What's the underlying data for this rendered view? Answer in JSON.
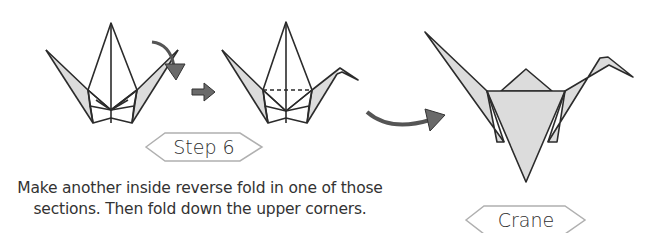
{
  "step_label": "Step 6",
  "final_label": "Crane",
  "instructions": {
    "line1": "Make another inside reverse fold in one of those",
    "line2": "sections. Then fold down the upper corners."
  },
  "icons": {
    "curved_fold_arrow": "curved-arrow-down",
    "next_arrow": "arrow-right",
    "result_arrow": "curved-arrow-right"
  },
  "colors": {
    "paper_fill": "#dcdcdc",
    "line": "#2b2b2b",
    "arrow": "#6a6a6a",
    "label_border": "#b0b0b0"
  }
}
